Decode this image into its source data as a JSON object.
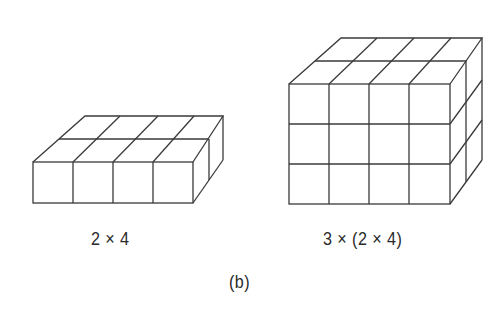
{
  "figure": {
    "panel_label": "(b)",
    "left_block": {
      "label": "2 × 4",
      "rows_deep": 2,
      "columns": 4,
      "layers": 1
    },
    "right_block": {
      "label": "3 × (2 × 4)",
      "rows_deep": 2,
      "columns": 4,
      "layers": 3
    },
    "colors": {
      "stroke": "#3a3a3a",
      "background": "#ffffff"
    }
  }
}
